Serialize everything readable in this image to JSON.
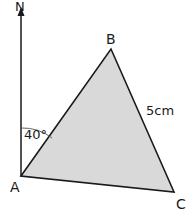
{
  "diagram": {
    "type": "bearing-triangle",
    "north_label": "N",
    "vertices": {
      "A": {
        "label": "A",
        "x": 21,
        "y": 176
      },
      "B": {
        "label": "B",
        "x": 111,
        "y": 49
      },
      "C": {
        "label": "C",
        "x": 174,
        "y": 192
      }
    },
    "side_label": "5cm",
    "angle_label": "40°",
    "colors": {
      "fill": "#d9d9d9",
      "stroke": "#1a1a1a",
      "background": "#ffffff"
    }
  }
}
